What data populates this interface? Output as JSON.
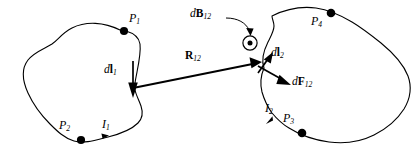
{
  "figure": {
    "background_color": "#ffffff",
    "stroke_color": "#000000",
    "width": 419,
    "height": 149
  },
  "labels": {
    "p1": "P",
    "p1_sub": "1",
    "p2": "P",
    "p2_sub": "2",
    "p3": "P",
    "p3_sub": "3",
    "p4": "P",
    "p4_sub": "4",
    "i1": "I",
    "i1_sub": "1",
    "i2": "I",
    "i2_sub": "2",
    "dl1_d": "d",
    "dl1_vec": "l",
    "dl1_sub": "1",
    "dl2_d": "d",
    "dl2_vec": "l",
    "dl2_sub": "2",
    "dB12_d": "d",
    "dB12_vec": "B",
    "dB12_sub": "12",
    "dF12_d": "d",
    "dF12_vec": "F",
    "dF12_sub": "12",
    "R12_vec": "R",
    "R12_sub": "12"
  },
  "symbols": {
    "field_out_of_page": "circled-dot"
  }
}
